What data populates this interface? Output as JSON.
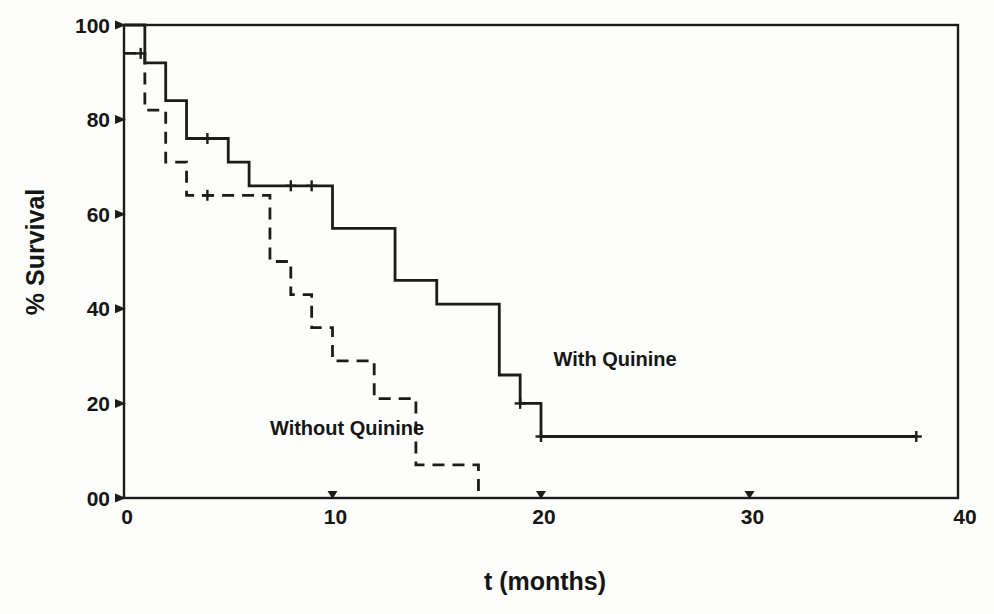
{
  "chart_data": {
    "type": "line",
    "subtype": "kaplan-meier-step-survival",
    "title": "",
    "xlabel": "t (months)",
    "ylabel": "% Survival",
    "xlim": [
      0,
      40
    ],
    "ylim": [
      0,
      100
    ],
    "grid": false,
    "frame_box": true,
    "ink_color": "#1c1c1c",
    "background_color": "#fdfdfb",
    "x_ticks": [
      {
        "value": 0,
        "label": "0",
        "tick_mark": false
      },
      {
        "value": 10,
        "label": "10",
        "tick_mark": true
      },
      {
        "value": 20,
        "label": "20",
        "tick_mark": true
      },
      {
        "value": 30,
        "label": "30",
        "tick_mark": true
      },
      {
        "value": 40,
        "label": "40",
        "tick_mark": false
      }
    ],
    "y_ticks": [
      {
        "value": 100,
        "label": "100"
      },
      {
        "value": 80,
        "label": "80"
      },
      {
        "value": 60,
        "label": "60"
      },
      {
        "value": 40,
        "label": "40"
      },
      {
        "value": 20,
        "label": "20"
      },
      {
        "value": 0,
        "label": "00"
      }
    ],
    "series": [
      {
        "name": "With Quinine",
        "slug": "with-quinine",
        "line_style": "solid",
        "survival_levels": [
          [
            0,
            100
          ],
          [
            1,
            92
          ],
          [
            2,
            84
          ],
          [
            3,
            76
          ],
          [
            5,
            71
          ],
          [
            6,
            66
          ],
          [
            10,
            57
          ],
          [
            13,
            46
          ],
          [
            15,
            41
          ],
          [
            18,
            26
          ],
          [
            19,
            20
          ],
          [
            20,
            13
          ]
        ],
        "end_t": 38,
        "censor_marks": [
          [
            4,
            76
          ],
          [
            8,
            66
          ],
          [
            9,
            66
          ],
          [
            19,
            20
          ],
          [
            20,
            13
          ],
          [
            38,
            13
          ]
        ],
        "label_anchor": {
          "t": 20.6,
          "pct": 28
        }
      },
      {
        "name": "Without Quinine",
        "slug": "without-quinine",
        "line_style": "dashed",
        "survival_levels": [
          [
            0,
            94
          ],
          [
            1,
            82
          ],
          [
            2,
            71
          ],
          [
            3,
            64
          ],
          [
            7,
            50
          ],
          [
            8,
            43
          ],
          [
            9,
            36
          ],
          [
            10,
            29
          ],
          [
            12,
            21
          ],
          [
            14,
            7
          ],
          [
            17,
            0
          ]
        ],
        "end_t": 17,
        "censor_marks": [
          [
            0.8,
            94
          ],
          [
            4,
            64
          ]
        ],
        "label_anchor": {
          "t": 7.0,
          "pct": 13.3
        }
      }
    ]
  }
}
